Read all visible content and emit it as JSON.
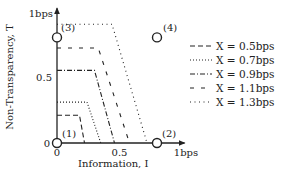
{
  "chart_data": {
    "type": "line",
    "title": "",
    "xlabel": "Information, I",
    "ylabel": "Non-Transparency, T",
    "xlim": [
      0,
      1
    ],
    "ylim": [
      0,
      1
    ],
    "x_ticks": [
      {
        "value": 0,
        "label": "0"
      },
      {
        "value": 0.5,
        "label": "0.5"
      },
      {
        "value": 1,
        "label": "1bps"
      }
    ],
    "y_ticks": [
      {
        "value": 0,
        "label": "0"
      },
      {
        "value": 0.5,
        "label": "0.5"
      },
      {
        "value": 1,
        "label": "1bps"
      }
    ],
    "grid": false,
    "legend_position": "right",
    "series": [
      {
        "name": "X = 0.5bps",
        "style": "dashed",
        "points": [
          [
            0,
            0.21
          ],
          [
            0.18,
            0.21
          ],
          [
            0.22,
            0
          ]
        ]
      },
      {
        "name": "X = 0.7bps",
        "style": "dotted",
        "points": [
          [
            0,
            0.31
          ],
          [
            0.24,
            0.31
          ],
          [
            0.35,
            0
          ]
        ]
      },
      {
        "name": "X = 0.9bps",
        "style": "dashdot",
        "points": [
          [
            0,
            0.55
          ],
          [
            0.3,
            0.55
          ],
          [
            0.46,
            0
          ]
        ]
      },
      {
        "name": "X = 1.1bps",
        "style": "longdash",
        "points": [
          [
            0,
            0.72
          ],
          [
            0.33,
            0.72
          ],
          [
            0.58,
            0
          ]
        ]
      },
      {
        "name": "X = 1.3bps",
        "style": "loosedot",
        "points": [
          [
            0,
            0.9
          ],
          [
            0.44,
            0.9
          ],
          [
            0.72,
            0
          ]
        ]
      }
    ],
    "annotations": [
      {
        "label": "(1)",
        "point": [
          0,
          0
        ]
      },
      {
        "label": "(2)",
        "point": [
          0.8,
          0
        ]
      },
      {
        "label": "(3)",
        "point": [
          0,
          0.8
        ]
      },
      {
        "label": "(4)",
        "point": [
          0.8,
          0.8
        ]
      }
    ]
  }
}
